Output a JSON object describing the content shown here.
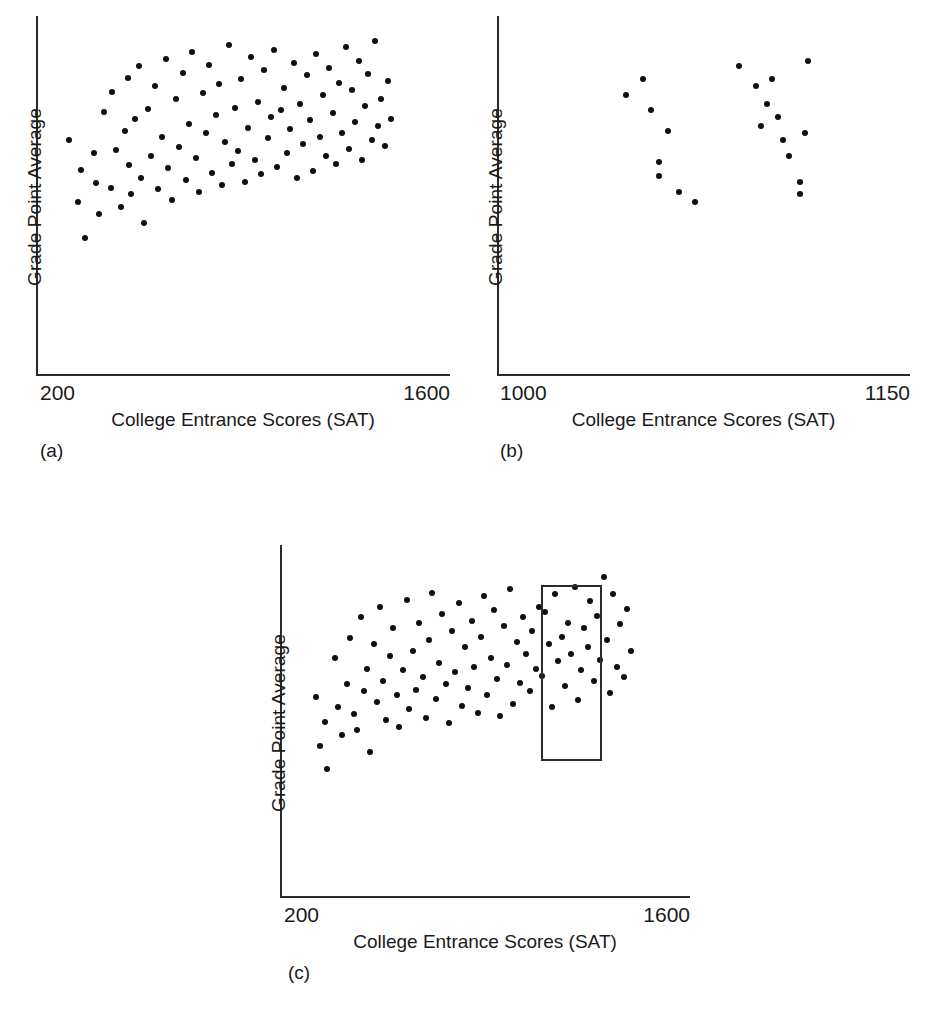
{
  "figure": {
    "background": "#ffffff",
    "dot_color": "#101010",
    "axis_color": "#2b2b2b"
  },
  "panels": [
    {
      "caption": "(a)",
      "xlabel": "College Entrance Scores (SAT)",
      "ylabel": "Grade Point Average",
      "xtick_left": "200",
      "xtick_right": "1600"
    },
    {
      "caption": "(b)",
      "xlabel": "College Entrance Scores (SAT)",
      "ylabel": "Grade Point Average",
      "xtick_left": "1000",
      "xtick_right": "1150"
    },
    {
      "caption": "(c)",
      "xlabel": "College Entrance Scores (SAT)",
      "ylabel": "Grade Point Average",
      "xtick_left": "200",
      "xtick_right": "1600"
    }
  ],
  "chart_data": [
    {
      "type": "scatter",
      "panel": "(a)",
      "title": "",
      "xlabel": "College Entrance Scores (SAT)",
      "ylabel": "Grade Point Average",
      "xlim": [
        200,
        1600
      ],
      "ylim": [
        0,
        4
      ],
      "xticks": [
        200,
        1600
      ],
      "yticks": [],
      "grid": false,
      "legend": "none",
      "description": "Unrestricted range: full SAT span shows a clear positive correlation with GPA.",
      "n_points": 95,
      "points": [
        [
          310,
          2.62
        ],
        [
          342,
          1.93
        ],
        [
          352,
          2.29
        ],
        [
          366,
          1.53
        ],
        [
          396,
          2.48
        ],
        [
          402,
          2.15
        ],
        [
          414,
          1.8
        ],
        [
          430,
          2.93
        ],
        [
          452,
          2.09
        ],
        [
          456,
          3.16
        ],
        [
          470,
          2.51
        ],
        [
          486,
          1.88
        ],
        [
          500,
          2.72
        ],
        [
          510,
          3.31
        ],
        [
          516,
          2.34
        ],
        [
          522,
          2.02
        ],
        [
          536,
          2.86
        ],
        [
          548,
          3.44
        ],
        [
          556,
          2.2
        ],
        [
          566,
          1.7
        ],
        [
          580,
          2.97
        ],
        [
          590,
          2.44
        ],
        [
          604,
          3.22
        ],
        [
          612,
          2.08
        ],
        [
          626,
          2.66
        ],
        [
          640,
          3.52
        ],
        [
          648,
          2.31
        ],
        [
          660,
          1.96
        ],
        [
          672,
          3.08
        ],
        [
          684,
          2.55
        ],
        [
          696,
          3.37
        ],
        [
          706,
          2.18
        ],
        [
          716,
          2.8
        ],
        [
          728,
          3.6
        ],
        [
          740,
          2.42
        ],
        [
          752,
          2.04
        ],
        [
          764,
          3.14
        ],
        [
          776,
          2.7
        ],
        [
          786,
          3.46
        ],
        [
          796,
          2.26
        ],
        [
          808,
          2.9
        ],
        [
          818,
          3.25
        ],
        [
          830,
          2.12
        ],
        [
          840,
          2.6
        ],
        [
          852,
          3.68
        ],
        [
          862,
          2.36
        ],
        [
          872,
          2.98
        ],
        [
          884,
          2.5
        ],
        [
          894,
          3.3
        ],
        [
          906,
          2.16
        ],
        [
          918,
          2.76
        ],
        [
          928,
          3.55
        ],
        [
          940,
          2.4
        ],
        [
          950,
          3.05
        ],
        [
          962,
          2.24
        ],
        [
          972,
          3.4
        ],
        [
          984,
          2.64
        ],
        [
          994,
          2.88
        ],
        [
          1006,
          3.62
        ],
        [
          1016,
          2.32
        ],
        [
          1028,
          2.96
        ],
        [
          1038,
          3.2
        ],
        [
          1050,
          2.48
        ],
        [
          1060,
          2.74
        ],
        [
          1072,
          3.48
        ],
        [
          1082,
          2.2
        ],
        [
          1094,
          3.02
        ],
        [
          1104,
          2.58
        ],
        [
          1116,
          3.34
        ],
        [
          1126,
          2.84
        ],
        [
          1138,
          2.28
        ],
        [
          1148,
          3.58
        ],
        [
          1160,
          2.66
        ],
        [
          1170,
          3.12
        ],
        [
          1182,
          2.44
        ],
        [
          1192,
          3.42
        ],
        [
          1204,
          2.92
        ],
        [
          1214,
          2.36
        ],
        [
          1226,
          3.26
        ],
        [
          1236,
          2.7
        ],
        [
          1248,
          3.66
        ],
        [
          1258,
          2.52
        ],
        [
          1270,
          3.18
        ],
        [
          1280,
          2.82
        ],
        [
          1292,
          3.5
        ],
        [
          1302,
          2.4
        ],
        [
          1314,
          3.0
        ],
        [
          1324,
          3.36
        ],
        [
          1336,
          2.62
        ],
        [
          1346,
          3.72
        ],
        [
          1358,
          2.78
        ],
        [
          1368,
          3.08
        ],
        [
          1380,
          2.56
        ],
        [
          1392,
          3.28
        ],
        [
          1402,
          2.86
        ]
      ]
    },
    {
      "type": "scatter",
      "panel": "(b)",
      "title": "",
      "xlabel": "College Entrance Scores (SAT)",
      "ylabel": "Grade Point Average",
      "xlim": [
        1000,
        1150
      ],
      "ylim": [
        0,
        4
      ],
      "xticks": [
        1000,
        1150
      ],
      "yticks": [],
      "grid": false,
      "legend": "none",
      "description": "Restricted range: narrow SAT slice (1000-1150) shows little or no apparent correlation.",
      "n_points": 20,
      "points": [
        [
          1053,
          3.3
        ],
        [
          1047,
          3.12
        ],
        [
          1056,
          2.96
        ],
        [
          1062,
          2.72
        ],
        [
          1059,
          2.38
        ],
        [
          1059,
          2.22
        ],
        [
          1066,
          2.05
        ],
        [
          1072,
          1.93
        ],
        [
          1088,
          3.44
        ],
        [
          1094,
          3.22
        ],
        [
          1100,
          3.3
        ],
        [
          1098,
          3.02
        ],
        [
          1096,
          2.78
        ],
        [
          1104,
          2.62
        ],
        [
          1102,
          2.88
        ],
        [
          1106,
          2.44
        ],
        [
          1110,
          2.16
        ],
        [
          1113,
          3.5
        ],
        [
          1112,
          2.7
        ],
        [
          1110,
          2.02
        ]
      ]
    },
    {
      "type": "scatter",
      "panel": "(c)",
      "title": "",
      "xlabel": "College Entrance Scores (SAT)",
      "ylabel": "Grade Point Average",
      "xlim": [
        200,
        1600
      ],
      "ylim": [
        0,
        4
      ],
      "xticks": [
        200,
        1600
      ],
      "yticks": [],
      "grid": false,
      "legend": "none",
      "description": "Full scatter with a rectangle marking the restricted SAT slice shown in panel (b).",
      "highlight_rect": {
        "x0": 1090,
        "x1": 1300,
        "y0": 1.55,
        "y1": 3.55
      },
      "n_points": 95,
      "points": [
        [
          322,
          2.28
        ],
        [
          336,
          1.72
        ],
        [
          352,
          2.0
        ],
        [
          360,
          1.46
        ],
        [
          388,
          2.72
        ],
        [
          398,
          2.16
        ],
        [
          412,
          1.85
        ],
        [
          428,
          2.42
        ],
        [
          440,
          2.95
        ],
        [
          452,
          2.08
        ],
        [
          462,
          1.9
        ],
        [
          476,
          3.18
        ],
        [
          486,
          2.34
        ],
        [
          498,
          2.6
        ],
        [
          508,
          1.66
        ],
        [
          520,
          2.88
        ],
        [
          530,
          2.22
        ],
        [
          542,
          3.3
        ],
        [
          552,
          2.46
        ],
        [
          562,
          2.02
        ],
        [
          576,
          2.74
        ],
        [
          586,
          3.06
        ],
        [
          598,
          2.3
        ],
        [
          608,
          1.94
        ],
        [
          620,
          2.58
        ],
        [
          632,
          3.38
        ],
        [
          642,
          2.14
        ],
        [
          654,
          2.8
        ],
        [
          666,
          2.36
        ],
        [
          676,
          3.12
        ],
        [
          688,
          2.5
        ],
        [
          698,
          2.04
        ],
        [
          710,
          2.92
        ],
        [
          720,
          3.46
        ],
        [
          732,
          2.26
        ],
        [
          744,
          2.66
        ],
        [
          754,
          3.22
        ],
        [
          766,
          2.42
        ],
        [
          776,
          1.98
        ],
        [
          788,
          3.02
        ],
        [
          798,
          2.56
        ],
        [
          810,
          3.34
        ],
        [
          820,
          2.18
        ],
        [
          832,
          2.84
        ],
        [
          842,
          2.38
        ],
        [
          854,
          3.14
        ],
        [
          864,
          2.62
        ],
        [
          876,
          2.1
        ],
        [
          886,
          2.96
        ],
        [
          898,
          3.42
        ],
        [
          908,
          2.3
        ],
        [
          920,
          2.72
        ],
        [
          930,
          3.26
        ],
        [
          942,
          2.48
        ],
        [
          952,
          2.06
        ],
        [
          964,
          3.08
        ],
        [
          974,
          2.64
        ],
        [
          986,
          3.5
        ],
        [
          996,
          2.2
        ],
        [
          1008,
          2.9
        ],
        [
          1018,
          2.44
        ],
        [
          1030,
          3.18
        ],
        [
          1040,
          2.76
        ],
        [
          1052,
          2.34
        ],
        [
          1062,
          3.02
        ],
        [
          1074,
          2.6
        ],
        [
          1084,
          3.3
        ],
        [
          1096,
          2.52
        ],
        [
          1106,
          3.24
        ],
        [
          1118,
          2.88
        ],
        [
          1128,
          2.16
        ],
        [
          1140,
          3.44
        ],
        [
          1150,
          2.68
        ],
        [
          1162,
          2.96
        ],
        [
          1172,
          2.4
        ],
        [
          1184,
          3.12
        ],
        [
          1194,
          2.76
        ],
        [
          1206,
          3.52
        ],
        [
          1216,
          2.24
        ],
        [
          1228,
          2.58
        ],
        [
          1238,
          3.06
        ],
        [
          1250,
          2.84
        ],
        [
          1260,
          3.36
        ],
        [
          1272,
          2.46
        ],
        [
          1284,
          3.2
        ],
        [
          1294,
          2.7
        ],
        [
          1306,
          3.64
        ],
        [
          1316,
          2.92
        ],
        [
          1328,
          2.32
        ],
        [
          1338,
          3.44
        ],
        [
          1350,
          2.62
        ],
        [
          1362,
          3.1
        ],
        [
          1374,
          2.5
        ],
        [
          1386,
          3.28
        ],
        [
          1398,
          2.8
        ]
      ]
    }
  ]
}
